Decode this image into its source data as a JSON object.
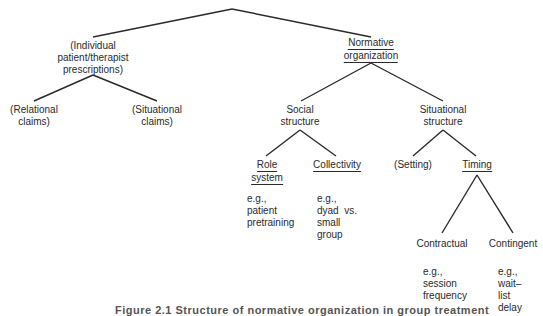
{
  "diagram": {
    "nodes": {
      "individual": {
        "lines": [
          "(Individual",
          "patient/therapist",
          "prescriptions)"
        ],
        "underlined": false
      },
      "normative": {
        "lines": [
          "Normative",
          "organization"
        ],
        "underlined": true
      },
      "relational": {
        "lines": [
          "(Relational",
          "claims)"
        ],
        "underlined": false
      },
      "situational_claims": {
        "lines": [
          "(Situational",
          "claims)"
        ],
        "underlined": false
      },
      "social": {
        "lines": [
          "Social",
          "structure"
        ],
        "underlined": false
      },
      "situational_structure": {
        "lines": [
          "Situational",
          "structure"
        ],
        "underlined": false
      },
      "role": {
        "lines": [
          "Role",
          "system"
        ],
        "underlined": true
      },
      "collectivity": {
        "lines": [
          "Collectivity"
        ],
        "underlined": true
      },
      "setting": {
        "lines": [
          "(Setting)"
        ],
        "underlined": false
      },
      "timing": {
        "lines": [
          "Timing"
        ],
        "underlined": true
      },
      "contractual": {
        "lines": [
          "Contractual"
        ],
        "underlined": false
      },
      "contingent": {
        "lines": [
          "Contingent"
        ],
        "underlined": false
      }
    },
    "examples": {
      "role": "e.g.,\npatient\npretraining",
      "collectivity": "e.g.,\ndyad  vs.\nsmall\ngroup",
      "contractual": "e.g.,\nsession\nfrequency",
      "contingent": "e.g.,\nwait–\nlist\ndelay"
    },
    "edges": [
      [
        "root",
        "individual"
      ],
      [
        "root",
        "normative"
      ],
      [
        "individual",
        "relational"
      ],
      [
        "individual",
        "situational_claims"
      ],
      [
        "normative",
        "social"
      ],
      [
        "normative",
        "situational_structure"
      ],
      [
        "social",
        "role"
      ],
      [
        "social",
        "collectivity"
      ],
      [
        "situational_structure",
        "setting"
      ],
      [
        "situational_structure",
        "timing"
      ],
      [
        "timing",
        "contractual"
      ],
      [
        "timing",
        "contingent"
      ]
    ],
    "caption": "Figure 2.1   Structure of normative organization in group treatment"
  }
}
